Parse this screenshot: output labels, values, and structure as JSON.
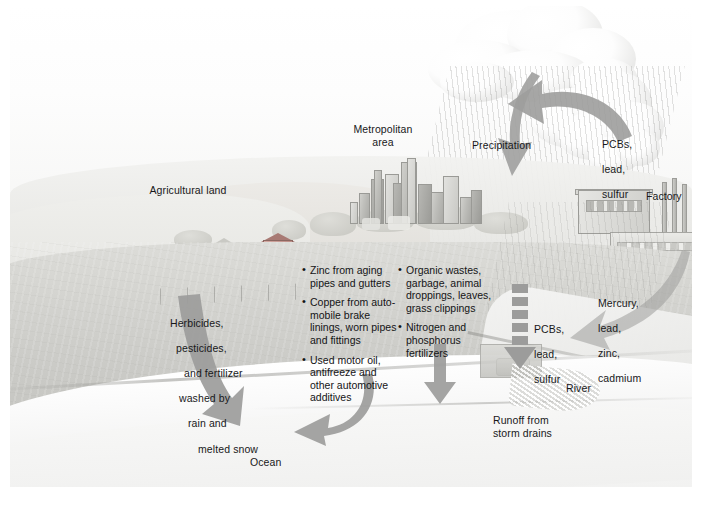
{
  "figure": {
    "labels": {
      "agricultural_land": "Agricultural land",
      "metropolitan_area": "Metropolitan\narea",
      "precipitation": "Precipitation",
      "factory": "Factory",
      "ocean": "Ocean",
      "river": "River",
      "runoff_storm_drains": "Runoff from\nstorm drains"
    },
    "callouts": {
      "factory_emissions": {
        "name": "PCBs, lead, sulfur (air emissions)",
        "lines": [
          "PCBs,",
          "lead,",
          "sulfur"
        ]
      },
      "atmospheric_deposition": {
        "name": "PCBs, lead, sulfur (deposition)",
        "lines": [
          "PCBs,",
          "lead,",
          "sulfur"
        ]
      },
      "industrial_discharge": {
        "name": "Mercury, lead, zinc, cadmium",
        "lines": [
          "Mercury,",
          "lead,",
          "zinc,",
          "cadmium"
        ]
      },
      "agricultural_runoff": {
        "name": "Herbicides, pesticides, and fertilizer washed by rain and melted snow",
        "lines": [
          "Herbicides,",
          "pesticides,",
          "and fertilizer",
          "washed by",
          "rain and",
          "melted snow"
        ]
      }
    },
    "bullet_groups": [
      {
        "name": "urban-metal-runoff",
        "items": [
          "Zinc from aging\npipes and gutters",
          "Copper from auto-\nmobile brake\nlinings, worn pipes\nand fittings",
          "Used motor oil,\nantifreeze and\nother automotive\nadditives"
        ]
      },
      {
        "name": "organic-nutrient-runoff",
        "items": [
          "Organic wastes,\ngarbage, animal\ndroppings, leaves,\ngrass clippings",
          "Nitrogen and\nphosphorus\nfertilizers"
        ]
      }
    ],
    "arrows": [
      {
        "name": "precipitation-arrow",
        "direction": "down-curved"
      },
      {
        "name": "emissions-to-cloud-arrow",
        "direction": "left-curved"
      },
      {
        "name": "agricultural-runoff-arrow",
        "direction": "down-left"
      },
      {
        "name": "urban-runoff-arrow",
        "direction": "down-left-curved"
      },
      {
        "name": "nutrient-runoff-arrow",
        "direction": "down"
      },
      {
        "name": "deposition-arrow",
        "direction": "down-dashed"
      },
      {
        "name": "industrial-discharge-arrow",
        "direction": "down-left-curved"
      }
    ],
    "colors": {
      "arrow_fill": "#9a9a99",
      "arrow_fill_light": "#adadac",
      "text": "#18181a",
      "land": "#d3d3cf",
      "water": "#f2f2f1",
      "barn": "#b98a83",
      "page_background": "#ffffff"
    }
  }
}
